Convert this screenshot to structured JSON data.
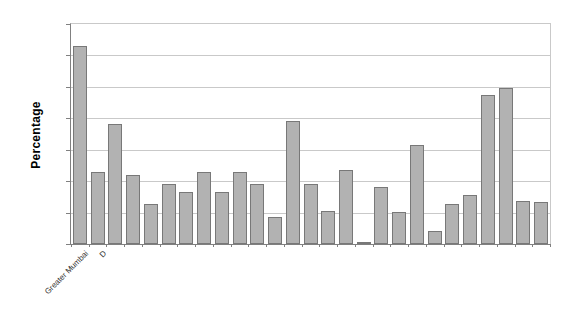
{
  "chart": {
    "colors": {
      "bar_fill": "#b2b2b2",
      "bar_border": "#787878",
      "gridline": "#c9c9c9",
      "axis": "#808080",
      "background": "#ffffff",
      "label_text": "#333333"
    }
  },
  "chart_data": {
    "type": "bar",
    "title": "",
    "xlabel": "",
    "ylabel": "Percentage",
    "categories": [
      "Greater Mumbai",
      "D",
      "",
      "",
      "",
      "",
      "",
      "",
      "",
      "",
      "",
      "",
      "",
      "",
      "",
      "",
      "",
      "",
      "",
      "",
      "",
      "",
      "",
      "",
      "",
      "",
      ""
    ],
    "values": [
      31.5,
      11.4,
      19.1,
      11.0,
      6.4,
      9.5,
      8.3,
      11.5,
      8.2,
      11.5,
      9.5,
      4.3,
      19.5,
      9.5,
      5.3,
      11.7,
      0.3,
      9.1,
      5.1,
      15.8,
      2.0,
      6.4,
      7.8,
      23.7,
      24.9,
      6.8,
      6.7
    ],
    "ylim": [
      0,
      35
    ],
    "gridline_interval": 5,
    "y_tick_labels_shown": false,
    "x_tick_labels_rotation_deg": 45,
    "grid": true,
    "legend": "none"
  }
}
